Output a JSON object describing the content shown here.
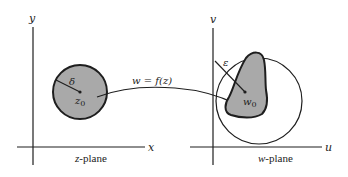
{
  "diagram": {
    "colors": {
      "ink": "#1e1e1e",
      "fill_gray": "#a9a9a9",
      "background": "#ffffff"
    },
    "z_plane": {
      "caption_var": "z",
      "caption_rest": "-plane",
      "x_axis_label": "x",
      "y_axis_label": "y",
      "disk_radius_label": "δ",
      "center_label_base": "z",
      "center_label_sub": "0"
    },
    "mapping": {
      "label": "w = f(z)"
    },
    "w_plane": {
      "caption_var": "w",
      "caption_rest": "-plane",
      "u_axis_label": "u",
      "v_axis_label": "v",
      "circle_radius_label": "ε",
      "center_label_base": "w",
      "center_label_sub": "0"
    }
  }
}
